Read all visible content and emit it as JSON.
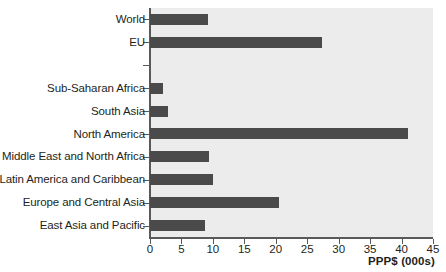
{
  "chart_data": {
    "type": "bar",
    "orientation": "horizontal",
    "title": "",
    "xlabel": "PPP$ (000s)",
    "ylabel": "",
    "xlim": [
      0,
      45
    ],
    "xticks": [
      0,
      5,
      10,
      15,
      20,
      25,
      30,
      35,
      40,
      45
    ],
    "xtick_labels": [
      "0",
      "5",
      "10",
      "15",
      "20",
      "25",
      "30",
      "35",
      "40",
      "45"
    ],
    "grid": false,
    "legend": null,
    "bar_color": "#4a4a4a",
    "plot_background": "#ececec",
    "axis_color": "#58595b",
    "categories": [
      "World",
      "EU",
      "",
      "Sub-Saharan Africa",
      "South Asia",
      "North America",
      "Middle East and North Africa",
      "Latin America and Caribbean",
      "Europe and Central Asia",
      "East Asia and Pacific"
    ],
    "values": [
      9.2,
      27.3,
      null,
      2.0,
      2.9,
      41.0,
      9.4,
      10.0,
      20.5,
      8.8
    ],
    "rows": [
      {
        "label": "World",
        "value": 9.2
      },
      {
        "label": "EU",
        "value": 27.3
      },
      {
        "label": "",
        "value": null
      },
      {
        "label": "Sub-Saharan Africa",
        "value": 2.0
      },
      {
        "label": "South Asia",
        "value": 2.9
      },
      {
        "label": "North America",
        "value": 41.0
      },
      {
        "label": "Middle East and North Africa",
        "value": 9.4
      },
      {
        "label": "Latin America and Caribbean",
        "value": 10.0
      },
      {
        "label": "Europe and Central Asia",
        "value": 20.5
      },
      {
        "label": "East Asia and Pacific",
        "value": 8.8
      }
    ]
  }
}
